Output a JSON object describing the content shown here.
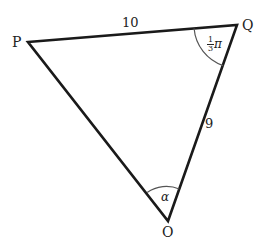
{
  "diagram": {
    "type": "triangle",
    "vertices": {
      "P": {
        "label": "P",
        "x": 28,
        "y": 42
      },
      "Q": {
        "label": "Q",
        "x": 237,
        "y": 25
      },
      "O": {
        "label": "O",
        "x": 168,
        "y": 221
      }
    },
    "sides": [
      {
        "from": "P",
        "to": "Q",
        "label": "10"
      },
      {
        "from": "Q",
        "to": "O",
        "label": "9"
      },
      {
        "from": "O",
        "to": "P",
        "label": ""
      }
    ],
    "angles": [
      {
        "at": "Q",
        "label_num": "1",
        "label_den": "3",
        "label_sym": "π"
      },
      {
        "at": "O",
        "label": "α"
      }
    ],
    "colors": {
      "line": "#1a1a1a",
      "arc": "#555555",
      "text": "#222222"
    }
  }
}
